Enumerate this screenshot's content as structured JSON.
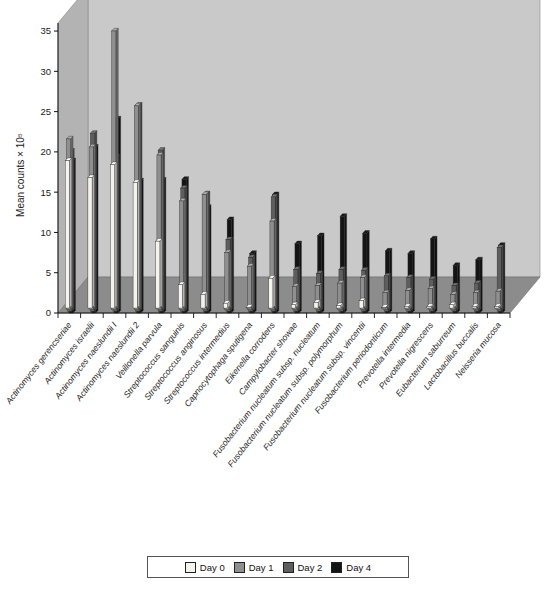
{
  "chart_data": {
    "type": "bar",
    "title": "",
    "subtitle": "",
    "xlabel": "",
    "ylabel": "Mean counts × 10⁵",
    "ylim": [
      0,
      36
    ],
    "yticks": [
      0,
      5,
      10,
      15,
      20,
      25,
      30,
      35
    ],
    "ytick_labels": [
      "0",
      "5",
      "10",
      "15",
      "20",
      "25",
      "30",
      "35"
    ],
    "grid": false,
    "projection": "3d-perspective",
    "legend_position": "bottom-center",
    "categories": [
      "Actinomyces gerencseriae",
      "Actinomyces israelii",
      "Actinomyces naeslundii I",
      "Actinomyces naeslundii 2",
      "Veillonella parvula",
      "Streptococcus sanguinis",
      "Streptococcus anginosus",
      "Streptococcus intermedius",
      "Capnocytophaga sputigena",
      "Eikenella corrodens",
      "Campylobacter showae",
      "Fusobacterium nucleatum subsp. nucleatum",
      "Fusobacterium nucleatum subsp. polymorphum",
      "Fusobacterium nucleatum subsp. vincentii",
      "Fusobacterium periodonticum",
      "Prevotella intermedia",
      "Prevotella nigrescens",
      "Eubacterium saburreum",
      "Lactobacillus buccalis",
      "Neisseria mucosa"
    ],
    "series": [
      {
        "name": "Day 0",
        "color": "#f5f3ee",
        "values": [
          18.3,
          16.2,
          17.8,
          15.6,
          8.3,
          2.9,
          1.7,
          0.6,
          0.1,
          3.7,
          0.4,
          0.7,
          0.3,
          0.9,
          0.1,
          0.2,
          0.2,
          0.4,
          0.2,
          0.2
        ]
      },
      {
        "name": "Day 1",
        "color": "#8f8f8f",
        "values": [
          21.2,
          20.2,
          34.6,
          25.3,
          19.2,
          13.5,
          14.3,
          7.1,
          5.4,
          11.0,
          2.9,
          3.0,
          3.3,
          4.0,
          2.1,
          2.4,
          2.6,
          1.9,
          2.1,
          2.3
        ]
      },
      {
        "name": "Day 2",
        "color": "#5e5e5e",
        "values": [
          19.9,
          22.1,
          19.2,
          25.6,
          20.0,
          15.3,
          14.6,
          8.9,
          6.7,
          14.2,
          5.2,
          4.7,
          5.2,
          5.1,
          4.4,
          4.2,
          4.0,
          3.2,
          3.5,
          7.9
        ]
      },
      {
        "name": "Day 4",
        "color": "#141414",
        "values": [
          18.9,
          20.6,
          24.1,
          16.4,
          16.5,
          16.6,
          13.1,
          11.6,
          7.4,
          14.7,
          8.6,
          9.6,
          12.0,
          9.9,
          7.7,
          7.4,
          9.2,
          5.9,
          6.6,
          8.4
        ]
      }
    ],
    "legend_entries": [
      {
        "label": "Day 0",
        "color": "#f5f3ee"
      },
      {
        "label": "Day 1",
        "color": "#8f8f8f"
      },
      {
        "label": "Day 2",
        "color": "#5e5e5e"
      },
      {
        "label": "Day 4",
        "color": "#141414"
      }
    ],
    "colors": {
      "wall_back": "#c9c9c9",
      "wall_left": "#b3b3b3",
      "floor": "#8c8c8c",
      "floor_front": "#a5a5a5",
      "axis": "#111111",
      "text": "#1a1a1a",
      "figure_background": "#ffffff"
    }
  }
}
